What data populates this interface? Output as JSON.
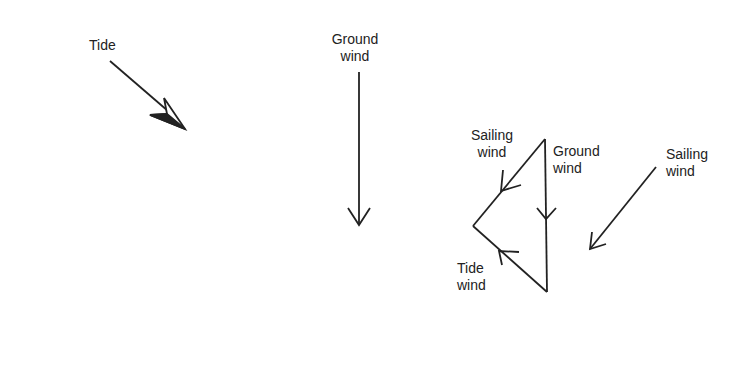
{
  "labels": {
    "tide": "Tide",
    "ground_wind_1": "Ground",
    "ground_wind_2": "wind",
    "tri_sailing_1": "Sailing",
    "tri_sailing_2": "wind",
    "tri_ground_1": "Ground",
    "tri_ground_2": "wind",
    "tri_tide_1": "Tide",
    "tri_tide_2": "wind",
    "sailing_1": "Sailing",
    "sailing_2": "wind"
  },
  "colors": {
    "stroke": "#222222",
    "text": "#222222",
    "background": "#ffffff"
  }
}
